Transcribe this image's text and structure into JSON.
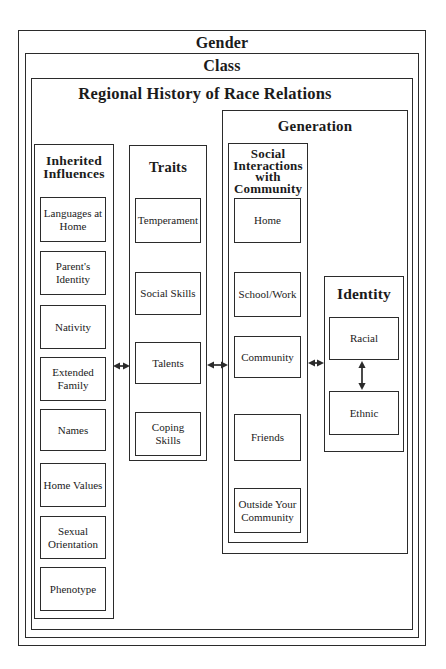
{
  "colors": {
    "line": "#2b2b2b",
    "text": "#1b1b1b",
    "background": "#ffffff"
  },
  "layers": {
    "gender": "Gender",
    "class": "Class",
    "regional_history": "Regional History of Race Relations",
    "generation": "Generation"
  },
  "inherited": {
    "title": "Inherited Influences",
    "items": [
      "Languages at Home",
      "Parent's Identity",
      "Nativity",
      "Extended Family",
      "Names",
      "Home Values",
      "Sexual Orientation",
      "Phenotype"
    ]
  },
  "traits": {
    "title": "Traits",
    "items": [
      "Temperament",
      "Social Skills",
      "Talents",
      "Coping Skills"
    ]
  },
  "social_interactions": {
    "title": "Social Interactions with Community",
    "items": [
      "Home",
      "School/Work",
      "Community",
      "Friends",
      "Outside Your Community"
    ]
  },
  "identity": {
    "title": "Identity",
    "items": [
      "Racial",
      "Ethnic"
    ]
  }
}
